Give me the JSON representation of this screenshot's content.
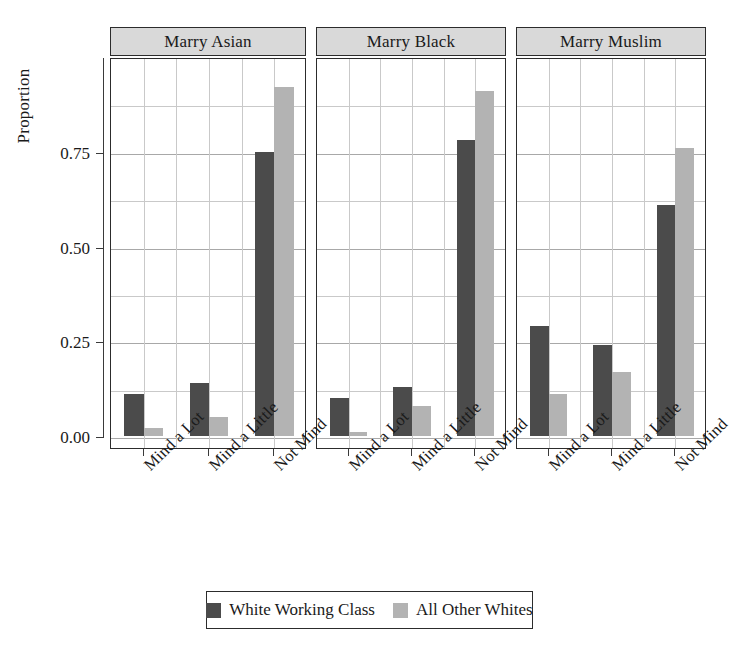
{
  "chart_data": {
    "type": "bar",
    "title": "",
    "xlabel": "",
    "ylabel": "Proportion",
    "ylim": [
      0,
      1.0
    ],
    "yticks": [
      0.0,
      0.25,
      0.5,
      0.75
    ],
    "ytick_labels": [
      "0.00",
      "0.25",
      "0.50",
      "0.75"
    ],
    "minor_gridlines": [
      0.125,
      0.375,
      0.625,
      0.875
    ],
    "grid": true,
    "legend_position": "bottom",
    "categories": [
      "Mind a Lot",
      "Mind a Little",
      "Not Mind"
    ],
    "series": [
      {
        "name": "White Working Class",
        "color": "#4b4b4b"
      },
      {
        "name": "All Other Whites",
        "color": "#b3b3b3"
      }
    ],
    "panels": [
      {
        "label": "Marry Asian",
        "values": {
          "White Working Class": [
            0.11,
            0.14,
            0.75
          ],
          "All Other Whites": [
            0.02,
            0.05,
            0.92
          ]
        }
      },
      {
        "label": "Marry Black",
        "values": {
          "White Working Class": [
            0.1,
            0.13,
            0.78
          ],
          "All Other Whites": [
            0.01,
            0.08,
            0.91
          ]
        }
      },
      {
        "label": "Marry Muslim",
        "values": {
          "White Working Class": [
            0.29,
            0.24,
            0.61
          ],
          "All Other Whites": [
            0.11,
            0.17,
            0.76
          ]
        }
      }
    ]
  },
  "axis": {
    "ylabel": "Proportion",
    "ytick_labels": [
      "0.75",
      "0.50",
      "0.25",
      "0.00"
    ]
  },
  "legend": {
    "items": [
      {
        "label": "White Working Class",
        "color": "#4b4b4b"
      },
      {
        "label": "All Other Whites",
        "color": "#b3b3b3"
      }
    ]
  }
}
